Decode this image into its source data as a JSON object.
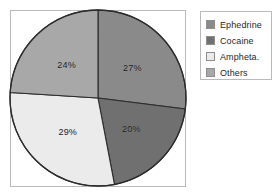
{
  "chart_data": {
    "type": "pie",
    "title": "",
    "subtitle": "",
    "xlabel": "",
    "ylabel": "",
    "grid": false,
    "legend_position": "right",
    "start_angle_deg": 0,
    "direction": "clockwise",
    "unit": "%",
    "categories": [
      "Ephedrine",
      "Cocaine",
      "Ampheta.",
      "Others"
    ],
    "values": [
      27,
      20,
      29,
      24
    ],
    "data_labels": [
      "27%",
      "20%",
      "29%",
      "24%"
    ],
    "colors": [
      "#8a8a8a",
      "#707070",
      "#ebebeb",
      "#a8a8a8"
    ],
    "slices": [
      {
        "label": "Ephedrine",
        "value": 27,
        "data_label": "27%",
        "color": "#8a8a8a"
      },
      {
        "label": "Cocaine",
        "value": 20,
        "data_label": "20%",
        "color": "#707070"
      },
      {
        "label": "Ampheta.",
        "value": 29,
        "data_label": "29%",
        "color": "#ebebeb"
      },
      {
        "label": "Others",
        "value": 24,
        "data_label": "24%",
        "color": "#a8a8a8"
      }
    ]
  },
  "legend": {
    "items": [
      {
        "label": "Ephedrine",
        "color": "#8a8a8a"
      },
      {
        "label": "Cocaine",
        "color": "#707070"
      },
      {
        "label": "Ampheta.",
        "color": "#ebebeb"
      },
      {
        "label": "Others",
        "color": "#a8a8a8"
      }
    ]
  },
  "style": {
    "outline_color": "#2b2b2b",
    "frame_color": "#b9b9b9",
    "background": "#ffffff",
    "label_color": "#1a1a1a"
  }
}
